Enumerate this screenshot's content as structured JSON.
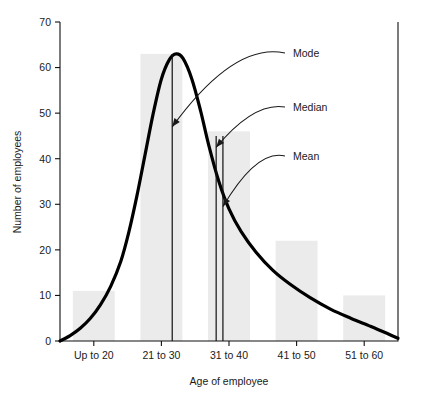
{
  "chart_data": {
    "type": "bar",
    "title": "",
    "subtitle": "",
    "xlabel": "Age of employee",
    "ylabel": "Number of employees",
    "categories": [
      "Up to 20",
      "21 to 30",
      "31 to 40",
      "41 to 50",
      "51 to 60"
    ],
    "values": [
      11,
      63,
      46,
      22,
      10
    ],
    "series": [
      {
        "name": "Number of employees",
        "values": [
          11,
          63,
          46,
          22,
          10
        ]
      }
    ],
    "ylim": [
      0,
      70
    ],
    "yticks": [
      0,
      10,
      20,
      30,
      40,
      50,
      60,
      70
    ],
    "ytick_labels": [
      "0",
      "10",
      "20",
      "30",
      "40",
      "50",
      "60",
      "70"
    ],
    "grid": false,
    "legend": false,
    "legend_position": "none",
    "bar_color": "#ebebeb",
    "curve_color": "#000000",
    "axis_color": "#111111",
    "overlay_curve": {
      "type": "line",
      "description": "smooth right-skewed frequency distribution curve",
      "points": [
        [
          0.0,
          0.0
        ],
        [
          0.15,
          1.2
        ],
        [
          0.3,
          2.8
        ],
        [
          0.45,
          5.0
        ],
        [
          0.6,
          8.0
        ],
        [
          0.75,
          12.0
        ],
        [
          0.9,
          17.5
        ],
        [
          1.02,
          24.0
        ],
        [
          1.14,
          32.0
        ],
        [
          1.26,
          41.0
        ],
        [
          1.38,
          50.0
        ],
        [
          1.5,
          57.5
        ],
        [
          1.62,
          61.8
        ],
        [
          1.72,
          63.0
        ],
        [
          1.82,
          62.0
        ],
        [
          1.95,
          57.5
        ],
        [
          2.08,
          50.5
        ],
        [
          2.2,
          43.0
        ],
        [
          2.35,
          35.0
        ],
        [
          2.5,
          29.0
        ],
        [
          2.68,
          24.0
        ],
        [
          2.9,
          19.5
        ],
        [
          3.15,
          15.5
        ],
        [
          3.4,
          12.5
        ],
        [
          3.7,
          9.5
        ],
        [
          4.0,
          7.0
        ],
        [
          4.3,
          5.0
        ],
        [
          4.6,
          3.2
        ],
        [
          4.85,
          1.6
        ],
        [
          5.0,
          0.6
        ]
      ]
    },
    "annotations": [
      {
        "label": "Mode",
        "value": 22.0,
        "line_x_category_fraction": 1.66,
        "arrow_target_value": 47.0,
        "label_x": 293,
        "label_y": 53
      },
      {
        "label": "Median",
        "value": 29.0,
        "line_x_category_fraction": 2.31,
        "arrow_target_value": 42.5,
        "label_x": 293,
        "label_y": 107
      },
      {
        "label": "Mean",
        "value": 30.0,
        "line_x_category_fraction": 2.41,
        "arrow_target_value": 29.5,
        "label_x": 293,
        "label_y": 156
      }
    ]
  },
  "axes": {
    "y_title": "Number of employees",
    "x_title": "Age of employee",
    "y_ticks": [
      "0",
      "10",
      "20",
      "30",
      "40",
      "50",
      "60",
      "70"
    ],
    "x_ticks": [
      "Up to 20",
      "21 to 30",
      "31 to 40",
      "41 to 50",
      "51 to 60"
    ]
  },
  "annotation_labels": {
    "mode": "Mode",
    "median": "Median",
    "mean": "Mean"
  }
}
